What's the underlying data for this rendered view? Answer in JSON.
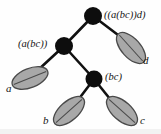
{
  "diagram": {
    "background_color": "#fefefe",
    "edge_color": "#111111",
    "node_fill": "#0d0d0d",
    "leaf_fill": "#a8a8a8",
    "leaf_stroke": "#4a4a4a",
    "label_color": "#141414",
    "internal_nodes": [
      {
        "id": "root",
        "label": "((a(bc))d)",
        "cx": 93,
        "cy": 16,
        "r": 9,
        "label_x": 104,
        "label_y": 10
      },
      {
        "id": "left-internal",
        "label": "(a(bc))",
        "cx": 64,
        "cy": 46,
        "r": 9,
        "label_x": 18,
        "label_y": 39
      },
      {
        "id": "right-internal",
        "label": "(bc)",
        "cx": 94,
        "cy": 79,
        "r": 8.5,
        "label_x": 105,
        "label_y": 72
      }
    ],
    "leaves": [
      {
        "id": "leaf-a",
        "label": "a",
        "cx": 30,
        "cy": 78,
        "rx": 19,
        "ry": 9.5,
        "rotation": -22,
        "label_x": 6,
        "label_y": 83
      },
      {
        "id": "leaf-b",
        "label": "b",
        "cx": 69,
        "cy": 111,
        "rx": 19,
        "ry": 9.5,
        "rotation": -42,
        "label_x": 43,
        "label_y": 115
      },
      {
        "id": "leaf-c",
        "label": "c",
        "cx": 122,
        "cy": 111,
        "rx": 19,
        "ry": 9.5,
        "rotation": 42,
        "label_x": 140,
        "label_y": 115
      },
      {
        "id": "leaf-d",
        "label": "d",
        "cx": 131,
        "cy": 48,
        "rx": 19,
        "ry": 9.5,
        "rotation": 48,
        "label_x": 143,
        "label_y": 55
      }
    ],
    "edges": [
      {
        "id": "root-to-left-internal",
        "x1": 93,
        "y1": 16,
        "x2": 64,
        "y2": 46
      },
      {
        "id": "root-to-leaf-d",
        "x1": 93,
        "y1": 16,
        "x2": 126,
        "y2": 41
      },
      {
        "id": "left-internal-to-leaf-a",
        "x1": 64,
        "y1": 46,
        "x2": 37,
        "y2": 71
      },
      {
        "id": "left-internal-to-right-internal",
        "x1": 64,
        "y1": 46,
        "x2": 94,
        "y2": 79
      },
      {
        "id": "right-internal-to-leaf-b",
        "x1": 94,
        "y1": 79,
        "x2": 75,
        "y2": 104
      },
      {
        "id": "right-internal-to-leaf-c",
        "x1": 94,
        "y1": 79,
        "x2": 114,
        "y2": 104
      }
    ]
  }
}
